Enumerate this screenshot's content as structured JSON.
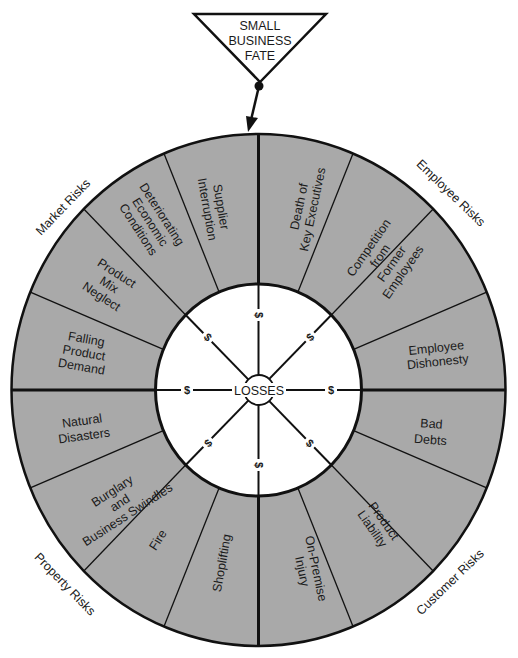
{
  "title": {
    "lines": [
      "SMALL",
      "BUSINESS",
      "FATE"
    ]
  },
  "center": {
    "label": "LOSSES",
    "dollar_sign": "$"
  },
  "colors": {
    "segment_fill": "#a9a9a9",
    "background": "#ffffff",
    "line": "#111111"
  },
  "categories": [
    {
      "label": "Market Risks"
    },
    {
      "label": "Employee Risks"
    },
    {
      "label": "Customer Risks"
    },
    {
      "label": "Property Risks"
    }
  ],
  "segments": [
    {
      "lines": [
        "Supplier",
        "Interruption"
      ]
    },
    {
      "lines": [
        "Deteriorating",
        "Economic",
        "Conditions"
      ]
    },
    {
      "lines": [
        "Product",
        "Mix",
        "Neglect"
      ]
    },
    {
      "lines": [
        "Falling",
        "Product",
        "Demand"
      ]
    },
    {
      "lines": [
        "Death of",
        "Key Executives"
      ]
    },
    {
      "lines": [
        "Competition",
        "from",
        "Former",
        "Employees"
      ]
    },
    {
      "lines": [
        "Employee",
        "Dishonesty"
      ]
    },
    {
      "lines": [
        "Bad",
        "Debts"
      ]
    },
    {
      "lines": [
        "Product",
        "Liability"
      ]
    },
    {
      "lines": [
        "On-Premise",
        "Injury"
      ]
    },
    {
      "lines": [
        "Natural",
        "Disasters"
      ]
    },
    {
      "lines": [
        "Burglary",
        "and",
        "Business Swindles"
      ]
    },
    {
      "lines": [
        "Fire"
      ]
    },
    {
      "lines": [
        "Shoplifting"
      ]
    }
  ]
}
